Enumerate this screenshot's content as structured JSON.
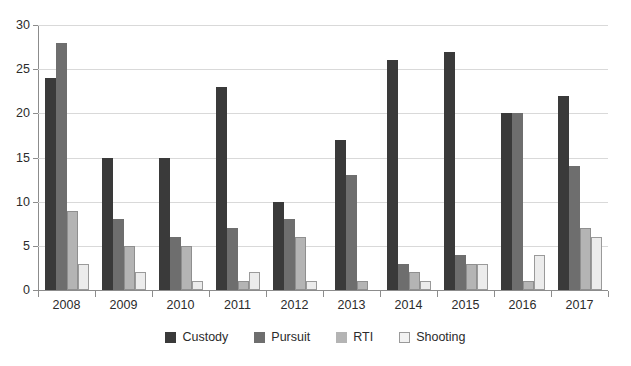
{
  "chart_data": {
    "type": "bar",
    "title": "",
    "subtitle": "",
    "xlabel": "",
    "ylabel": "",
    "ylim": [
      0,
      30
    ],
    "yticks": [
      0,
      5,
      10,
      15,
      20,
      25,
      30
    ],
    "ytick_labels": [
      "0",
      "5",
      "10",
      "15",
      "20",
      "25",
      "30"
    ],
    "grid": true,
    "legend_position": "bottom-center",
    "categories": [
      "2008",
      "2009",
      "2010",
      "2011",
      "2012",
      "2013",
      "2014",
      "2015",
      "2016",
      "2017"
    ],
    "series": [
      {
        "name": "Custody",
        "color": "#3a3a3a",
        "values": [
          24,
          15,
          15,
          23,
          10,
          17,
          26,
          27,
          20,
          22
        ]
      },
      {
        "name": "Pursuit",
        "color": "#6e6e6e",
        "values": [
          28,
          8,
          6,
          7,
          8,
          13,
          3,
          4,
          20,
          14
        ]
      },
      {
        "name": "RTI",
        "color": "#b4b4b4",
        "values": [
          9,
          5,
          5,
          1,
          6,
          1,
          2,
          3,
          1,
          7
        ]
      },
      {
        "name": "Shooting",
        "color": "#ececec",
        "values": [
          3,
          2,
          1,
          2,
          1,
          0,
          1,
          3,
          4,
          6
        ]
      }
    ]
  }
}
